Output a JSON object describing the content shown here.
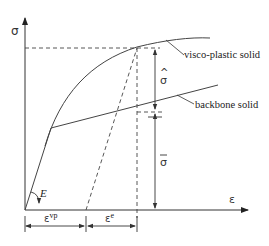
{
  "diagram": {
    "axes": {
      "y_label": "σ",
      "x_label": "ε"
    },
    "curves": {
      "visco_plastic": {
        "label": "visco-plastic solid"
      },
      "backbone": {
        "label": "backbone solid"
      }
    },
    "annotations": {
      "modulus": "E",
      "sigma_hat": "σ",
      "sigma_hat_accent": "^",
      "sigma_bar": "σ",
      "strain_viscoplastic_base": "ε",
      "strain_viscoplastic_sup": "vp",
      "strain_elastic_base": "ε",
      "strain_elastic_sup": "e"
    },
    "colors": {
      "line": "#333333",
      "background": "#ffffff"
    }
  }
}
